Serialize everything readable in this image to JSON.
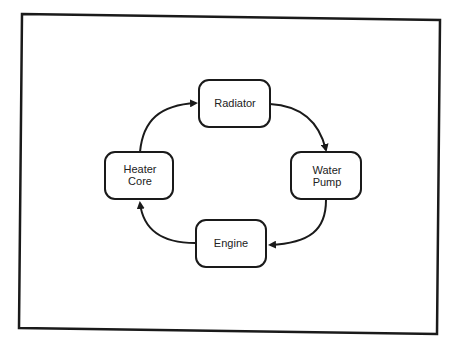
{
  "diagram": {
    "type": "cycle-flow",
    "nodes": [
      {
        "id": "radiator",
        "lines": [
          "Radiator"
        ]
      },
      {
        "id": "water-pump",
        "lines": [
          "Water",
          "Pump"
        ]
      },
      {
        "id": "engine",
        "lines": [
          "Engine"
        ]
      },
      {
        "id": "heater-core",
        "lines": [
          "Heater",
          "Core"
        ]
      }
    ],
    "edges": [
      {
        "from": "radiator",
        "to": "water-pump"
      },
      {
        "from": "water-pump",
        "to": "engine"
      },
      {
        "from": "engine",
        "to": "heater-core"
      },
      {
        "from": "heater-core",
        "to": "radiator"
      }
    ],
    "colors": {
      "stroke": "#1a1a1a",
      "background": "#ffffff",
      "text": "#222222"
    }
  }
}
